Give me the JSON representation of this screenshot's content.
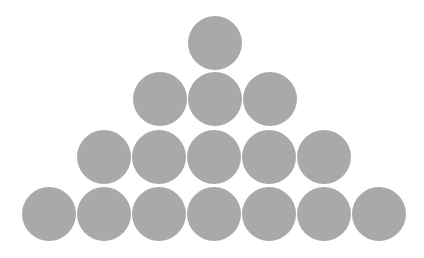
{
  "diagram": {
    "fill_color": "#a9a9a9",
    "background": "#ffffff",
    "circle_diameter": 54,
    "rows": [
      {
        "count": 1,
        "cy": 43,
        "cx": [
          215
        ]
      },
      {
        "count": 3,
        "cy": 99,
        "cx": [
          160,
          215,
          270
        ]
      },
      {
        "count": 5,
        "cy": 157,
        "cx": [
          104,
          159,
          214,
          269,
          324
        ]
      },
      {
        "count": 7,
        "cy": 214,
        "cx": [
          49,
          104,
          159,
          214,
          269,
          324,
          379
        ]
      }
    ]
  }
}
